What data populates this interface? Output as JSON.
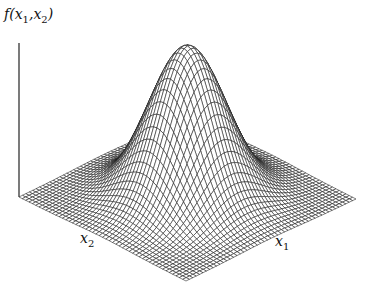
{
  "chart_data": {
    "type": "surface3d",
    "title": "",
    "function": "bivariate standard normal density f(x1,x2)",
    "zlabel": "f(x1,x2)",
    "xlabel": "x1",
    "ylabel": "x2",
    "labels": {
      "z": {
        "base": "f(",
        "v1": "x",
        "s1": "1",
        "sep": ",",
        "v2": "x",
        "s2": "2",
        "close": ")"
      },
      "x1": {
        "base": "x",
        "sub": "1"
      },
      "x2": {
        "base": "x",
        "sub": "2"
      }
    },
    "grid": {
      "n": 50,
      "range": [
        -3,
        3
      ]
    },
    "sigma": 1,
    "peak_height_px": 152,
    "projection": {
      "front_corner": [
        186,
        281
      ],
      "left_corner": [
        19,
        197
      ],
      "right_corner": [
        356,
        199
      ],
      "z_axis_top": [
        19,
        43
      ]
    },
    "ticks": "none",
    "style": {
      "line_color": "#1a1a1a",
      "fill": "#ffffff",
      "background": "#ffffff"
    }
  }
}
